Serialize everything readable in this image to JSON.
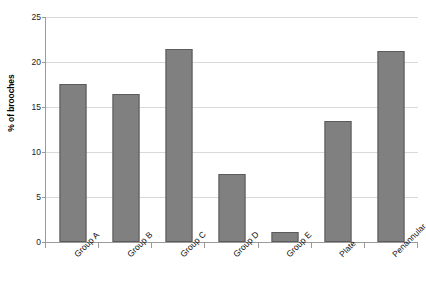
{
  "chart_data": {
    "type": "bar",
    "title": "",
    "xlabel": "",
    "ylabel": "% of brooches",
    "categories": [
      "Group A",
      "Group B",
      "Group C",
      "Group D",
      "Group E",
      "Plate",
      "Penannular"
    ],
    "values": [
      17.6,
      16.5,
      21.5,
      7.6,
      1.1,
      13.5,
      21.2
    ],
    "ylim": [
      0,
      25
    ],
    "yticks": [
      0,
      5,
      10,
      15,
      20,
      25
    ],
    "ytick_labels": [
      "0",
      "5",
      "10",
      "15",
      "20",
      "25"
    ],
    "grid": true,
    "legend": false,
    "colors": {
      "bar_fill": "#808080",
      "bar_stroke": "#5b5b5b",
      "gridline": "#d9d9d9",
      "axis": "#9a9a9a",
      "background": "#ffffff",
      "text": "#111111"
    }
  }
}
